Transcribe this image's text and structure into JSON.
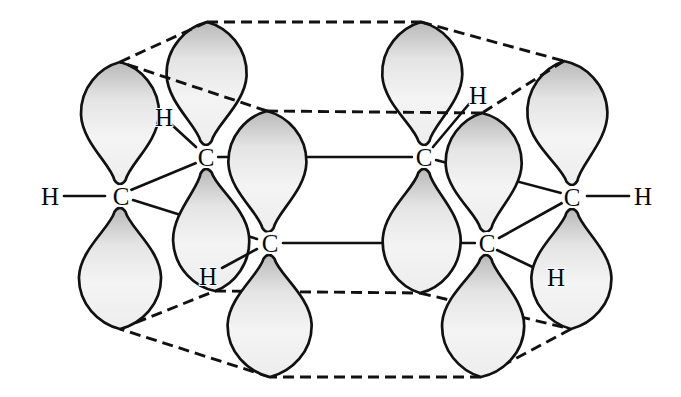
{
  "figure": {
    "carbon_labels": [
      "C",
      "C",
      "C",
      "C",
      "C",
      "C"
    ],
    "hydrogen_labels": [
      "H",
      "H",
      "H",
      "H",
      "H",
      "H"
    ],
    "colors": {
      "background": "#ffffff",
      "line": "#111111",
      "lobe_shade_dark": "#b9b9b9",
      "lobe_shade_mid": "#e4e4e4",
      "lobe_shade_light": "#f4f4f4"
    }
  }
}
